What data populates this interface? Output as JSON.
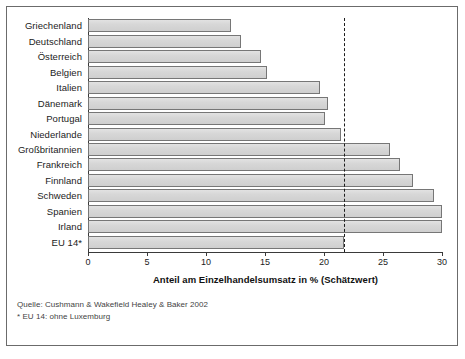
{
  "chart_data": {
    "type": "bar",
    "orientation": "horizontal",
    "title": "",
    "xlabel": "Anteil am Einzelhandelsumsatz in % (Schätzwert)",
    "ylabel": "",
    "xlim": [
      0,
      30
    ],
    "xticks": [
      0,
      5,
      10,
      15,
      20,
      25,
      30
    ],
    "xtick_labels": [
      "0",
      "5",
      "10",
      "15",
      "20",
      "25",
      "30"
    ],
    "grid": false,
    "legend": null,
    "categories": [
      "Griechenland",
      "Deutschland",
      "Österreich",
      "Belgien",
      "Italien",
      "Dänemark",
      "Portugal",
      "Niederlande",
      "Großbritannien",
      "Frankreich",
      "Finnland",
      "Schweden",
      "Spanien",
      "Irland",
      "EU 14*"
    ],
    "values": [
      12.1,
      13.0,
      14.7,
      15.2,
      19.7,
      20.3,
      20.1,
      21.4,
      25.6,
      26.4,
      27.5,
      29.3,
      30.0,
      30.0,
      21.7
    ],
    "reference_line": {
      "value": 21.7,
      "style": "dashed",
      "label": "EU 14*"
    },
    "bar_fill": "#d6d6d6",
    "bar_border": "#767676",
    "axis_color": "#3a3a3a"
  },
  "footnotes": {
    "source": "Quelle: Cushmann & Wakefield Healey & Baker 2002",
    "note": "* EU 14: ohne Luxemburg"
  }
}
